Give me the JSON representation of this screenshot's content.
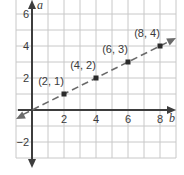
{
  "chart_data": {
    "type": "line",
    "title": "",
    "xlabel": "b",
    "ylabel": "a",
    "xlim": [
      -1,
      9
    ],
    "ylim": [
      -3,
      6.8
    ],
    "grid": true,
    "x_ticks": [
      2,
      4,
      6,
      8
    ],
    "y_ticks": [
      6,
      4,
      2,
      -2
    ],
    "tick_labels": {
      "x": [
        "2",
        "4",
        "6",
        "8"
      ],
      "y": [
        "6",
        "4",
        "2",
        "−2"
      ]
    },
    "series": [
      {
        "name": "line through points",
        "style": "dashed",
        "color": "#6b6b6b",
        "points": [
          {
            "x": 2,
            "y": 1,
            "label": "(2, 1)"
          },
          {
            "x": 4,
            "y": 2,
            "label": "(4, 2)"
          },
          {
            "x": 6,
            "y": 3,
            "label": "(6, 3)"
          },
          {
            "x": 8,
            "y": 4,
            "label": "(8, 4)"
          }
        ]
      }
    ]
  },
  "colors": {
    "grid": "#c8c8c8",
    "axis": "#3d3d3d",
    "line": "#6b6b6b",
    "point": "#2b2b2b"
  }
}
